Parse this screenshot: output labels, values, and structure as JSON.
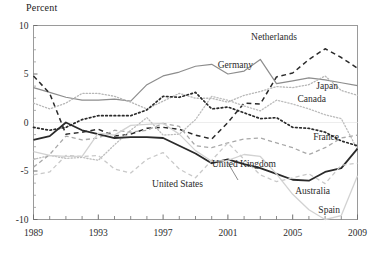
{
  "chart_data": {
    "type": "line",
    "title": "Percent",
    "xlabel": "",
    "ylabel": "Percent",
    "xlim": [
      1989,
      2009
    ],
    "ylim": [
      -10,
      10
    ],
    "ytick_values": [
      10,
      5,
      0,
      -5,
      -10
    ],
    "ytick_labels": [
      "10",
      "5",
      "0",
      "-5",
      "-10"
    ],
    "yminor_step": 1.25,
    "xtick_values": [
      1989,
      1990,
      1991,
      1992,
      1993,
      1994,
      1995,
      1996,
      1997,
      1998,
      1999,
      2000,
      2001,
      2002,
      2003,
      2004,
      2005,
      2006,
      2007,
      2008,
      2009
    ],
    "xtick_labels_shown": [
      "1989",
      "1993",
      "1997",
      "2001",
      "2005",
      "2009"
    ],
    "xtick_labeled_values": [
      1989,
      1993,
      1997,
      2001,
      2005,
      2009
    ],
    "grid": false,
    "legend_position": "inline-labels",
    "x": [
      1989,
      1990,
      1991,
      1992,
      1993,
      1994,
      1995,
      1996,
      1997,
      1998,
      1999,
      2000,
      2001,
      2002,
      2003,
      2004,
      2005,
      2006,
      2007,
      2008,
      2009
    ],
    "series": [
      {
        "name": "Netherlands",
        "color": "#8d8d8d",
        "style": "solid",
        "width": 1.2,
        "label": "Netherlands",
        "label_x": 297,
        "label_y": 40,
        "values": [
          3.6,
          3.1,
          2.6,
          2.3,
          2.3,
          2.4,
          2.2,
          3.9,
          4.8,
          5.2,
          5.8,
          6.0,
          5.0,
          5.3,
          6.5,
          4.0,
          4.3,
          4.6,
          4.4,
          4.1,
          3.8
        ]
      },
      {
        "name": "Germany",
        "color": "#2a2a2a",
        "style": "dashed",
        "width": 1.5,
        "label": "Germany",
        "label_x": 253,
        "label_y": 68,
        "values": [
          4.8,
          3.0,
          -1.2,
          -1.0,
          -0.7,
          -1.4,
          -1.2,
          -0.6,
          -0.5,
          -0.7,
          -1.3,
          -1.7,
          0.0,
          2.0,
          1.9,
          4.7,
          5.1,
          6.5,
          7.6,
          6.7,
          5.6
        ]
      },
      {
        "name": "Japan",
        "color": "#b7b7b7",
        "style": "dotted",
        "width": 1.3,
        "label": "Japan",
        "label_x": 338,
        "label_y": 89,
        "values": [
          2.0,
          1.4,
          2.0,
          3.0,
          3.0,
          2.7,
          2.1,
          1.4,
          2.2,
          3.0,
          2.5,
          2.5,
          2.1,
          2.8,
          3.2,
          3.7,
          3.6,
          3.9,
          4.8,
          3.3,
          2.8
        ]
      },
      {
        "name": "Canada",
        "color": "#bdbdbd",
        "style": "dotted",
        "width": 1.3,
        "label": "Canada",
        "label_x": 326,
        "label_y": 102,
        "values": [
          -3.8,
          -3.4,
          -3.7,
          -3.6,
          -3.9,
          -2.3,
          -0.8,
          0.5,
          -1.3,
          -1.2,
          0.3,
          2.7,
          2.3,
          1.7,
          1.2,
          2.3,
          1.9,
          1.4,
          0.8,
          0.4,
          -2.8
        ]
      },
      {
        "name": "France",
        "color": "#2a2a2a",
        "style": "dotted",
        "width": 1.7,
        "label": "France",
        "label_x": 339,
        "label_y": 140,
        "values": [
          -0.5,
          -0.8,
          -0.5,
          0.3,
          0.7,
          0.7,
          0.7,
          1.3,
          2.7,
          2.6,
          3.1,
          1.4,
          1.6,
          1.0,
          0.4,
          0.5,
          -0.5,
          -0.6,
          -1.0,
          -1.9,
          -2.4
        ]
      },
      {
        "name": "United Kingdom",
        "color": "#a8a8a8",
        "style": "dashed",
        "width": 1.3,
        "label": "United Kingdom",
        "label_x": 276,
        "label_y": 167,
        "values": [
          -4.6,
          -3.3,
          -1.4,
          -1.8,
          -1.6,
          -0.8,
          -1.0,
          -0.8,
          -0.1,
          -0.4,
          -2.4,
          -2.6,
          -2.1,
          -1.7,
          -1.6,
          -2.1,
          -2.6,
          -3.3,
          -2.6,
          -1.6,
          -1.3
        ]
      },
      {
        "name": "United States",
        "color": "#2a2a2a",
        "style": "solid",
        "width": 1.8,
        "label": "United States",
        "label_x": 203,
        "label_y": 187,
        "values": [
          -1.8,
          -1.4,
          0.0,
          -0.8,
          -1.2,
          -1.6,
          -1.5,
          -1.5,
          -1.6,
          -2.4,
          -3.2,
          -4.2,
          -3.8,
          -4.3,
          -4.7,
          -5.3,
          -5.9,
          -6.0,
          -5.1,
          -4.7,
          -2.7
        ]
      },
      {
        "name": "Australia",
        "color": "#c9c9c9",
        "style": "dashed",
        "width": 1.3,
        "label": "Australia",
        "label_x": 330,
        "label_y": 194,
        "values": [
          -5.4,
          -5.1,
          -3.4,
          -3.5,
          -3.4,
          -4.8,
          -5.2,
          -3.8,
          -3.1,
          -4.8,
          -5.7,
          -3.9,
          -2.1,
          -3.8,
          -5.4,
          -6.1,
          -5.7,
          -5.3,
          -6.3,
          -4.4,
          -4.2
        ]
      },
      {
        "name": "Spain",
        "color": "#d2d2d2",
        "style": "solid",
        "width": 1.3,
        "label": "Spain",
        "label_x": 340,
        "label_y": 213,
        "values": [
          -3.0,
          -3.4,
          -3.5,
          -3.5,
          -1.1,
          -1.3,
          -0.3,
          -0.2,
          -0.1,
          -1.2,
          -2.9,
          -4.0,
          -3.9,
          -3.3,
          -3.5,
          -5.3,
          -7.4,
          -9.0,
          -10.0,
          -9.6,
          -5.5
        ]
      }
    ]
  },
  "labels": {
    "us_leader_note": "United States"
  }
}
